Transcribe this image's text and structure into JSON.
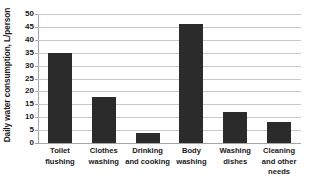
{
  "chart_data": {
    "type": "bar",
    "title": "",
    "xlabel": "",
    "ylabel": "Daily water consumption, L/person",
    "ylim": [
      0,
      50
    ],
    "yticks": [
      0,
      5,
      10,
      15,
      20,
      25,
      30,
      35,
      40,
      45,
      50
    ],
    "ytick_labels": [
      "0",
      "5",
      "10",
      "15",
      "20",
      "25",
      "30",
      "35",
      "40",
      "45",
      "50"
    ],
    "grid": "horizontal",
    "legend": "none",
    "bar_color": "#2b2b2b",
    "gridline_color": "#c9c9c9",
    "axis_color": "#a6a6a6",
    "background_color": "#ffffff",
    "categories": [
      "Toilet flushing",
      "Clothes washing",
      "Drinking and cooking",
      "Body washing",
      "Washing dishes",
      "Cleaning and other needs"
    ],
    "category_label_lines": [
      [
        "Toilet",
        "flushing"
      ],
      [
        "Clothes",
        "washing"
      ],
      [
        "Drinking",
        "and cooking"
      ],
      [
        "Body",
        "washing"
      ],
      [
        "Washing",
        "dishes"
      ],
      [
        "Cleaning",
        "and other",
        "needs"
      ]
    ],
    "values": [
      35,
      18,
      4,
      46,
      12,
      8
    ]
  }
}
